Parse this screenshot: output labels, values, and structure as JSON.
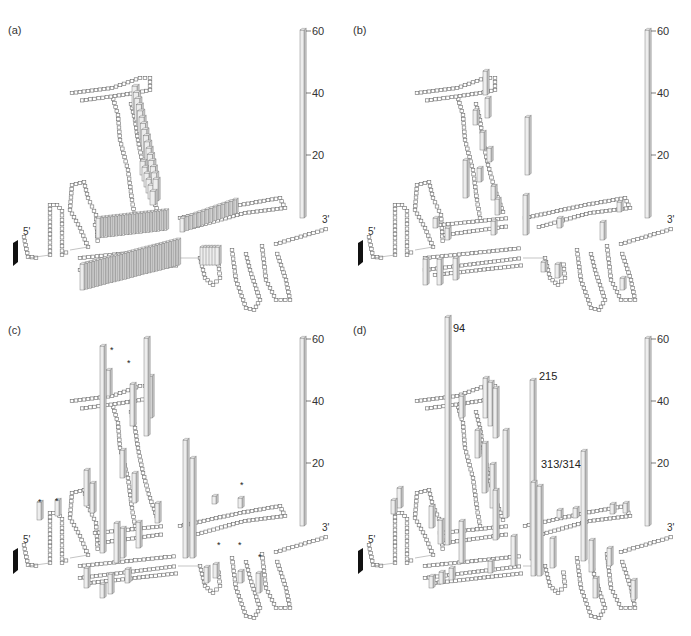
{
  "figure": {
    "panels": [
      {
        "id": "a",
        "label": "(a)"
      },
      {
        "id": "b",
        "label": "(b)"
      },
      {
        "id": "c",
        "label": "(c)"
      },
      {
        "id": "d",
        "label": "(d)"
      }
    ],
    "scale_ticks": [
      "60",
      "40",
      "20"
    ],
    "five_prime_label": "5'",
    "three_prime_label": "3'"
  },
  "chart_data": [
    {
      "type": "bar3d-on-rna-secondary-structure",
      "panel": "(a)",
      "title": "",
      "zlabel": "",
      "zlim": [
        0,
        60
      ],
      "z_ticks": [
        20,
        40,
        60
      ],
      "ends": {
        "start": "5'",
        "end": "3'"
      },
      "description": "Broad low-level signal (~5–10) across the central multi-branch helices and the long diagonal stem",
      "bars": [
        {
          "region": "long-diagonal-stem",
          "approx_height": 8,
          "count": 22
        },
        {
          "region": "central-helix-upper",
          "approx_height": 8,
          "count": 26
        },
        {
          "region": "central-helix-lower",
          "approx_height": 10,
          "count": 30
        },
        {
          "region": "right-arm",
          "approx_height": 7,
          "count": 10
        }
      ],
      "annotations": []
    },
    {
      "type": "bar3d-on-rna-secondary-structure",
      "panel": "(b)",
      "zlim": [
        0,
        60
      ],
      "z_ticks": [
        20,
        40,
        60
      ],
      "ends": {
        "start": "5'",
        "end": "3'"
      },
      "description": "Sparse peaks, max ~25",
      "bars": [
        {
          "region": "diagonal-stem",
          "approx_height": 10,
          "count": 14
        },
        {
          "region": "central-junction",
          "approx_height": 25,
          "count": 1
        },
        {
          "region": "central-left",
          "approx_height": 14,
          "count": 1
        },
        {
          "region": "lower-left",
          "approx_height": 10,
          "count": 5
        },
        {
          "region": "right-arm",
          "approx_height": 8,
          "count": 4
        }
      ],
      "annotations": []
    },
    {
      "type": "bar3d-on-rna-secondary-structure",
      "panel": "(c)",
      "zlim": [
        0,
        60
      ],
      "z_ticks": [
        20,
        40,
        60
      ],
      "ends": {
        "start": "5'",
        "end": "3'"
      },
      "description": "Several tall peaks (~55–60) near the top of the diagonal stem and ~38 at the central junction; asterisks mark selected sites",
      "bars": [
        {
          "region": "diagonal-stem-base",
          "approx_height": 58,
          "count": 1
        },
        {
          "region": "diagonal-stem-top",
          "approx_height": 45,
          "count": 3
        },
        {
          "region": "central-junction",
          "approx_height": 38,
          "count": 2
        },
        {
          "region": "left-hairpins",
          "approx_height": 10,
          "count": 8
        },
        {
          "region": "right-hairpins",
          "approx_height": 7,
          "count": 6
        }
      ],
      "annotations": [
        {
          "symbol": "*",
          "count": 9
        }
      ]
    },
    {
      "type": "bar3d-on-rna-secondary-structure",
      "panel": "(d)",
      "zlim": [
        0,
        60
      ],
      "z_ticks": [
        20,
        40,
        60
      ],
      "ends": {
        "start": "5'",
        "end": "3'"
      },
      "description": "Strong peaks at nucleotide 94 (~68), 215 (~58) and 313/314 (~30)",
      "bars": [
        {
          "position": "94",
          "approx_height": 68
        },
        {
          "position": "215",
          "approx_height": 58
        },
        {
          "position": "313/314",
          "approx_height": 30
        }
      ],
      "annotations": [
        {
          "label": "94"
        },
        {
          "label": "215"
        },
        {
          "label": "313/314"
        }
      ]
    }
  ]
}
